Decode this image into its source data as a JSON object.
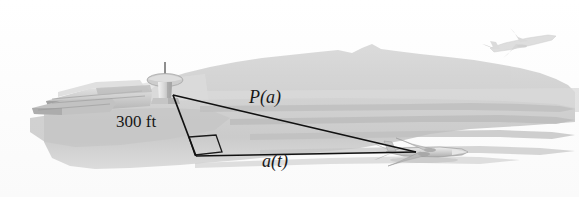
{
  "figure": {
    "background_color": "#ffffff",
    "line_color": "#1a1a1a",
    "ground_color": "#cfcfcf",
    "haze_color": "#d8d8d8"
  },
  "labels": {
    "height": "300 ft",
    "hypotenuse": "P(a)",
    "base": "a(t)"
  },
  "scene_objects": {
    "control_tower": "control-tower",
    "terminal_buildings": "terminal-buildings",
    "ground_airplane": "airplane-on-runway",
    "flying_airplane": "airplane-in-sky",
    "hills": "background-hills",
    "runway": "runway-stripes",
    "right_angle": "right-angle-marker"
  },
  "geometry": {
    "apex": [
      173,
      95
    ],
    "corner": [
      196,
      156
    ],
    "far_point": [
      416,
      152
    ]
  }
}
